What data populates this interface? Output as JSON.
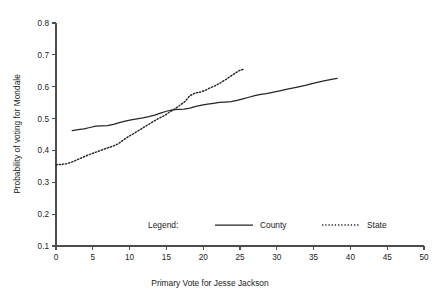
{
  "chart_data": {
    "type": "line",
    "title": "",
    "xlabel": "Primary Vote for Jesse Jackson",
    "ylabel": "Probability of voting for Mondale",
    "xlim": [
      0,
      50
    ],
    "ylim": [
      0.1,
      0.8
    ],
    "xticks": [
      0,
      5,
      10,
      15,
      20,
      25,
      30,
      35,
      40,
      45,
      50
    ],
    "yticks": [
      0.1,
      0.2,
      0.3,
      0.4,
      0.5,
      0.6,
      0.7,
      0.8
    ],
    "xtick_labels": [
      "0",
      "5",
      "10",
      "15",
      "20",
      "25",
      "30",
      "35",
      "40",
      "45",
      "50"
    ],
    "ytick_labels": [
      "0.1",
      "0.2",
      "0.3",
      "0.4",
      "0.5",
      "0.6",
      "0.7",
      "0.8"
    ],
    "grid": false,
    "legend_position": "inside-bottom-center",
    "legend_title": "Legend:",
    "series": [
      {
        "name": "County",
        "style": "solid",
        "color": "#262626",
        "points": [
          [
            2.2,
            0.462
          ],
          [
            3.0,
            0.465
          ],
          [
            3.8,
            0.468
          ],
          [
            4.6,
            0.472
          ],
          [
            5.4,
            0.476
          ],
          [
            6.2,
            0.477
          ],
          [
            7.0,
            0.478
          ],
          [
            7.8,
            0.482
          ],
          [
            8.6,
            0.487
          ],
          [
            9.4,
            0.492
          ],
          [
            10.2,
            0.496
          ],
          [
            11.0,
            0.499
          ],
          [
            11.8,
            0.502
          ],
          [
            12.6,
            0.506
          ],
          [
            13.4,
            0.511
          ],
          [
            14.2,
            0.517
          ],
          [
            15.0,
            0.523
          ],
          [
            15.8,
            0.527
          ],
          [
            16.6,
            0.529
          ],
          [
            17.4,
            0.53
          ],
          [
            18.2,
            0.533
          ],
          [
            19.0,
            0.538
          ],
          [
            19.8,
            0.542
          ],
          [
            20.6,
            0.545
          ],
          [
            21.4,
            0.548
          ],
          [
            22.2,
            0.551
          ],
          [
            23.0,
            0.552
          ],
          [
            23.8,
            0.553
          ],
          [
            24.6,
            0.557
          ],
          [
            25.4,
            0.562
          ],
          [
            26.2,
            0.567
          ],
          [
            27.0,
            0.572
          ],
          [
            27.8,
            0.576
          ],
          [
            28.6,
            0.578
          ],
          [
            29.4,
            0.582
          ],
          [
            30.4,
            0.587
          ],
          [
            31.6,
            0.593
          ],
          [
            32.8,
            0.599
          ],
          [
            34.0,
            0.605
          ],
          [
            35.2,
            0.612
          ],
          [
            36.4,
            0.618
          ],
          [
            37.6,
            0.624
          ],
          [
            38.2,
            0.626
          ]
        ]
      },
      {
        "name": "State",
        "style": "dotted",
        "color": "#262626",
        "points": [
          [
            0.0,
            0.355
          ],
          [
            0.7,
            0.356
          ],
          [
            1.4,
            0.358
          ],
          [
            2.1,
            0.363
          ],
          [
            2.8,
            0.37
          ],
          [
            3.5,
            0.377
          ],
          [
            4.2,
            0.384
          ],
          [
            4.9,
            0.39
          ],
          [
            5.6,
            0.396
          ],
          [
            6.3,
            0.402
          ],
          [
            7.0,
            0.408
          ],
          [
            7.7,
            0.413
          ],
          [
            8.4,
            0.42
          ],
          [
            9.1,
            0.432
          ],
          [
            9.8,
            0.443
          ],
          [
            10.5,
            0.452
          ],
          [
            11.2,
            0.462
          ],
          [
            11.9,
            0.472
          ],
          [
            12.6,
            0.482
          ],
          [
            13.3,
            0.492
          ],
          [
            14.0,
            0.501
          ],
          [
            14.7,
            0.509
          ],
          [
            15.4,
            0.52
          ],
          [
            16.1,
            0.53
          ],
          [
            16.8,
            0.541
          ],
          [
            17.5,
            0.553
          ],
          [
            18.2,
            0.572
          ],
          [
            18.9,
            0.58
          ],
          [
            19.6,
            0.583
          ],
          [
            20.3,
            0.589
          ],
          [
            21.0,
            0.597
          ],
          [
            21.7,
            0.604
          ],
          [
            22.4,
            0.613
          ],
          [
            23.1,
            0.623
          ],
          [
            23.8,
            0.634
          ],
          [
            24.5,
            0.645
          ],
          [
            25.1,
            0.653
          ],
          [
            25.6,
            0.655
          ]
        ]
      }
    ]
  },
  "legend": {
    "title": "Legend:",
    "entries": [
      {
        "label": "County",
        "style": "solid"
      },
      {
        "label": "State",
        "style": "dotted"
      }
    ]
  },
  "axes": {
    "x_title": "Primary Vote for Jesse Jackson",
    "y_title": "Probability of voting for Mondale"
  },
  "colors": {
    "line": "#262626",
    "axis": "#4d4d4d",
    "text": "#1a1a1a",
    "background": "#ffffff"
  }
}
